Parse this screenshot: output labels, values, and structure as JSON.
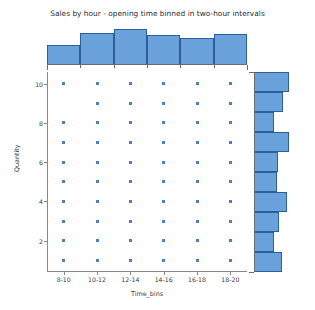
{
  "chart_data": {
    "type": "scatter",
    "title": "Sales by hour - opening time binned in two-hour intervals",
    "xlabel": "Time_bins",
    "ylabel": "Quantity",
    "categories": [
      "8-10",
      "10-12",
      "12-14",
      "14-16",
      "16-18",
      "18-20"
    ],
    "y_ticks": [
      2,
      4,
      6,
      8,
      10
    ],
    "ylim": [
      0.4,
      10.6
    ],
    "grid": false,
    "legend": null,
    "marker_color": "#4d7fc4",
    "bar_color": "#6aa3dc",
    "bar_edge_color": "#2c5f9e",
    "points": [
      {
        "x": "8-10",
        "y": 10
      },
      {
        "x": "10-12",
        "y": 10
      },
      {
        "x": "12-14",
        "y": 10
      },
      {
        "x": "14-16",
        "y": 10
      },
      {
        "x": "16-18",
        "y": 10
      },
      {
        "x": "18-20",
        "y": 10
      },
      {
        "x": "10-12",
        "y": 9
      },
      {
        "x": "12-14",
        "y": 9
      },
      {
        "x": "14-16",
        "y": 9
      },
      {
        "x": "16-18",
        "y": 9
      },
      {
        "x": "18-20",
        "y": 9
      },
      {
        "x": "8-10",
        "y": 8
      },
      {
        "x": "10-12",
        "y": 8
      },
      {
        "x": "12-14",
        "y": 8
      },
      {
        "x": "14-16",
        "y": 8
      },
      {
        "x": "16-18",
        "y": 8
      },
      {
        "x": "18-20",
        "y": 8
      },
      {
        "x": "8-10",
        "y": 7
      },
      {
        "x": "10-12",
        "y": 7
      },
      {
        "x": "12-14",
        "y": 7
      },
      {
        "x": "14-16",
        "y": 7
      },
      {
        "x": "16-18",
        "y": 7
      },
      {
        "x": "18-20",
        "y": 7
      },
      {
        "x": "8-10",
        "y": 6
      },
      {
        "x": "10-12",
        "y": 6
      },
      {
        "x": "12-14",
        "y": 6
      },
      {
        "x": "14-16",
        "y": 6
      },
      {
        "x": "16-18",
        "y": 6
      },
      {
        "x": "18-20",
        "y": 6
      },
      {
        "x": "8-10",
        "y": 5
      },
      {
        "x": "10-12",
        "y": 5
      },
      {
        "x": "12-14",
        "y": 5
      },
      {
        "x": "14-16",
        "y": 5
      },
      {
        "x": "16-18",
        "y": 5
      },
      {
        "x": "18-20",
        "y": 5
      },
      {
        "x": "8-10",
        "y": 4
      },
      {
        "x": "10-12",
        "y": 4
      },
      {
        "x": "12-14",
        "y": 4
      },
      {
        "x": "14-16",
        "y": 4
      },
      {
        "x": "16-18",
        "y": 4
      },
      {
        "x": "18-20",
        "y": 4
      },
      {
        "x": "8-10",
        "y": 3
      },
      {
        "x": "10-12",
        "y": 3
      },
      {
        "x": "12-14",
        "y": 3
      },
      {
        "x": "14-16",
        "y": 3
      },
      {
        "x": "16-18",
        "y": 3
      },
      {
        "x": "18-20",
        "y": 3
      },
      {
        "x": "8-10",
        "y": 2
      },
      {
        "x": "10-12",
        "y": 2
      },
      {
        "x": "12-14",
        "y": 2
      },
      {
        "x": "14-16",
        "y": 2
      },
      {
        "x": "16-18",
        "y": 2
      },
      {
        "x": "18-20",
        "y": 2
      },
      {
        "x": "8-10",
        "y": 1
      },
      {
        "x": "10-12",
        "y": 1
      },
      {
        "x": "12-14",
        "y": 1
      },
      {
        "x": "14-16",
        "y": 1
      },
      {
        "x": "16-18",
        "y": 1
      },
      {
        "x": "18-20",
        "y": 1
      }
    ],
    "top_histogram": {
      "type": "bar",
      "orientation": "vertical",
      "categories": [
        "8-10",
        "10-12",
        "12-14",
        "14-16",
        "16-18",
        "18-20"
      ],
      "values": [
        47,
        74,
        82,
        69,
        62,
        72
      ],
      "max": 90
    },
    "right_histogram": {
      "type": "bar",
      "orientation": "horizontal",
      "categories": [
        10,
        9,
        8,
        7,
        6,
        5,
        4,
        3,
        2,
        1
      ],
      "values": [
        78,
        66,
        46,
        78,
        54,
        52,
        74,
        56,
        46,
        62
      ],
      "max": 90
    }
  }
}
